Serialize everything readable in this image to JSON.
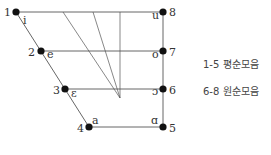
{
  "diagram": {
    "type": "vowel-quadrilateral",
    "points": [
      {
        "num": "1",
        "ipa": "i",
        "x": 16,
        "y": 12
      },
      {
        "num": "2",
        "ipa": "e",
        "x": 41,
        "y": 51
      },
      {
        "num": "3",
        "ipa": "ɛ",
        "x": 65,
        "y": 89
      },
      {
        "num": "4",
        "ipa": "a",
        "x": 89,
        "y": 127
      },
      {
        "num": "5",
        "ipa": "ɑ",
        "x": 163,
        "y": 127
      },
      {
        "num": "6",
        "ipa": "ɔ",
        "x": 163,
        "y": 89
      },
      {
        "num": "7",
        "ipa": "o",
        "x": 163,
        "y": 51
      },
      {
        "num": "8",
        "ipa": "u",
        "x": 163,
        "y": 12
      }
    ],
    "labels": {
      "p1_num": "1",
      "p1_ipa": "i",
      "p2_num": "2",
      "p2_ipa": "e",
      "p3_num": "3",
      "p3_ipa": "ɛ",
      "p4_num": "4",
      "p4_ipa": "a",
      "p5_num": "5",
      "p5_ipa": "ɑ",
      "p6_num": "6",
      "p6_ipa": "ɔ",
      "p7_num": "7",
      "p7_ipa": "o",
      "p8_num": "8",
      "p8_ipa": "u"
    },
    "line_color": "#555555",
    "dot_color": "#111111"
  },
  "legend": {
    "item1": "1-5 평순모음",
    "item2": "6-8 원순모음"
  }
}
